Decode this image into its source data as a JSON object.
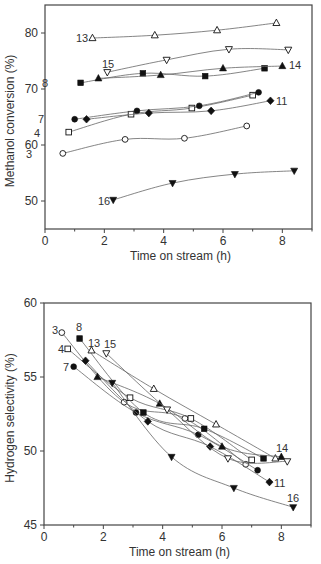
{
  "chart_data": [
    {
      "type": "line",
      "title": "",
      "xlabel": "Time on stream (h)",
      "ylabel": "Methanol conversion (%)",
      "xlim": [
        0,
        9
      ],
      "ylim": [
        45,
        85
      ],
      "xticks": [
        0,
        2,
        4,
        6,
        8
      ],
      "yticks": [
        50,
        60,
        70,
        80
      ],
      "grid": false,
      "legend": "inline labels",
      "frame": {
        "left": 45,
        "right": 312,
        "top": 5,
        "bottom": 229
      },
      "series": [
        {
          "name": "3",
          "marker": "open-circle",
          "x": [
            0.6,
            2.7,
            4.7,
            6.8
          ],
          "y": [
            58.5,
            61.0,
            61.2,
            63.4
          ],
          "label_pos": [
            26,
            158
          ]
        },
        {
          "name": "4",
          "marker": "open-square",
          "x": [
            0.8,
            2.9,
            4.95,
            7.0
          ],
          "y": [
            62.3,
            65.5,
            66.6,
            68.9
          ],
          "label_pos": [
            34,
            137
          ]
        },
        {
          "name": "7",
          "marker": "filled-circle",
          "x": [
            1.0,
            3.1,
            5.2,
            7.2
          ],
          "y": [
            64.6,
            66.1,
            67.0,
            69.4
          ],
          "label_pos": [
            38,
            123
          ]
        },
        {
          "name": "8",
          "marker": "filled-square",
          "x": [
            1.2,
            3.3,
            5.4,
            7.4
          ],
          "y": [
            71.1,
            72.8,
            72.3,
            73.7
          ],
          "label_pos": [
            42,
            87
          ]
        },
        {
          "name": "11",
          "marker": "filled-diamond",
          "x": [
            1.4,
            3.5,
            5.6,
            7.6
          ],
          "y": [
            64.6,
            65.7,
            66.1,
            67.9
          ],
          "label_pos": [
            276,
            105
          ]
        },
        {
          "name": "13",
          "marker": "open-triangle",
          "x": [
            1.6,
            3.7,
            5.8,
            7.8
          ],
          "y": [
            79.1,
            79.6,
            80.5,
            81.8
          ],
          "label_pos": [
            76,
            42
          ]
        },
        {
          "name": "14",
          "marker": "filled-triangle",
          "x": [
            1.8,
            3.9,
            6.0,
            8.0
          ],
          "y": [
            71.9,
            72.5,
            73.7,
            74.1
          ],
          "label_pos": [
            289,
            69
          ]
        },
        {
          "name": "15",
          "marker": "open-down-triangle",
          "x": [
            2.1,
            4.1,
            6.2,
            8.2
          ],
          "y": [
            73.0,
            75.2,
            77.1,
            77.0
          ],
          "label_pos": [
            102,
            68
          ]
        },
        {
          "name": "16",
          "marker": "filled-down-triangle",
          "x": [
            2.3,
            4.3,
            6.4,
            8.4
          ],
          "y": [
            50.2,
            53.2,
            54.8,
            55.4
          ],
          "label_pos": [
            98,
            205
          ]
        }
      ]
    },
    {
      "type": "line",
      "title": "",
      "xlabel": "Time on stream (h)",
      "ylabel": "Hydrogen selectivity (%)",
      "xlim": [
        0,
        9
      ],
      "ylim": [
        45,
        60
      ],
      "xticks": [
        0,
        2,
        4,
        6,
        8
      ],
      "yticks": [
        45,
        50,
        55,
        60
      ],
      "grid": false,
      "legend": "inline labels",
      "frame": {
        "left": 44,
        "right": 311,
        "top": 303,
        "bottom": 525
      },
      "series": [
        {
          "name": "3",
          "marker": "open-circle",
          "x": [
            0.6,
            2.7,
            4.75,
            6.8
          ],
          "y": [
            58.0,
            53.3,
            52.2,
            49.1
          ],
          "label_pos": [
            52,
            334
          ]
        },
        {
          "name": "4",
          "marker": "open-square",
          "x": [
            0.8,
            2.9,
            4.95,
            7.0
          ],
          "y": [
            56.9,
            53.6,
            52.2,
            49.4
          ],
          "label_pos": [
            58,
            353
          ]
        },
        {
          "name": "7",
          "marker": "filled-circle",
          "x": [
            1.0,
            3.1,
            5.2,
            7.2
          ],
          "y": [
            55.7,
            52.6,
            51.1,
            48.7
          ],
          "label_pos": [
            63,
            371
          ]
        },
        {
          "name": "8",
          "marker": "filled-square",
          "x": [
            1.2,
            3.35,
            5.4,
            7.4
          ],
          "y": [
            57.6,
            52.6,
            51.5,
            49.5
          ],
          "label_pos": [
            76,
            331
          ]
        },
        {
          "name": "11",
          "marker": "filled-diamond",
          "x": [
            1.4,
            3.5,
            5.6,
            7.6
          ],
          "y": [
            56.1,
            52.0,
            50.3,
            47.9
          ],
          "label_pos": [
            274,
            487
          ]
        },
        {
          "name": "13",
          "marker": "open-triangle",
          "x": [
            1.6,
            3.7,
            5.8,
            7.8
          ],
          "y": [
            56.8,
            54.2,
            51.8,
            49.5
          ],
          "label_pos": [
            88,
            347
          ]
        },
        {
          "name": "14",
          "marker": "filled-triangle",
          "x": [
            1.8,
            3.9,
            6.0,
            8.0
          ],
          "y": [
            55.0,
            53.2,
            50.3,
            49.6
          ],
          "label_pos": [
            276,
            452
          ]
        },
        {
          "name": "15",
          "marker": "open-down-triangle",
          "x": [
            2.1,
            4.15,
            6.2,
            8.2
          ],
          "y": [
            56.6,
            52.8,
            49.5,
            49.3
          ],
          "label_pos": [
            104,
            348
          ]
        },
        {
          "name": "16",
          "marker": "filled-down-triangle",
          "x": [
            2.3,
            4.3,
            6.4,
            8.4
          ],
          "y": [
            54.6,
            49.6,
            47.5,
            46.2
          ],
          "label_pos": [
            287,
            502
          ]
        }
      ]
    }
  ],
  "line_color": "#666666",
  "marker_color": "#111111"
}
